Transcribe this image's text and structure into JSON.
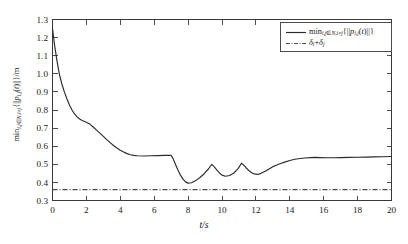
{
  "chart_data": {
    "type": "line",
    "title": "",
    "xlabel": "t/s",
    "ylabel": "min_{i,j∈N,i≠j}{||p_{i,j}(t)||}/m",
    "xlim": [
      0,
      20
    ],
    "ylim": [
      0.3,
      1.3
    ],
    "grid": false,
    "legend_position": "top-right",
    "xticks": [
      "0",
      "2",
      "4",
      "6",
      "8",
      "10",
      "12",
      "14",
      "16",
      "18",
      "20"
    ],
    "xtick_values": [
      0,
      2,
      4,
      6,
      8,
      10,
      12,
      14,
      16,
      18,
      20
    ],
    "yticks": [
      "0.3",
      "0.4",
      "0.5",
      "0.6",
      "0.7",
      "0.8",
      "0.9",
      "1.0",
      "1.1",
      "1.2",
      "1.3"
    ],
    "ytick_values": [
      0.3,
      0.4,
      0.5,
      0.6,
      0.7,
      0.8,
      0.9,
      1.0,
      1.1,
      1.2,
      1.3
    ],
    "series": [
      {
        "name": "min_distance",
        "legend_label_plain": "min_{i,j∈N,i≠j}{||p_{i,j}(t)||}",
        "style": "solid",
        "color": "#2b2b2b",
        "x": [
          0.0,
          0.12,
          0.25,
          0.4,
          0.55,
          0.7,
          0.85,
          1.0,
          1.15,
          1.3,
          1.45,
          1.6,
          1.75,
          1.9,
          2.05,
          2.2,
          2.4,
          2.6,
          2.8,
          3.0,
          3.2,
          3.4,
          3.6,
          3.8,
          4.0,
          4.2,
          4.4,
          4.6,
          4.8,
          5.0,
          5.4,
          5.8,
          6.2,
          6.6,
          6.95,
          7.0,
          7.1,
          7.25,
          7.4,
          7.55,
          7.7,
          7.85,
          8.0,
          8.2,
          8.45,
          8.7,
          8.95,
          9.2,
          9.4,
          9.55,
          9.7,
          9.85,
          10.0,
          10.2,
          10.45,
          10.7,
          10.95,
          11.15,
          11.3,
          11.45,
          11.6,
          11.75,
          11.9,
          12.1,
          12.3,
          12.55,
          12.8,
          13.0,
          13.2,
          13.45,
          13.7,
          14.0,
          14.3,
          14.6,
          14.9,
          15.2,
          15.5,
          15.8,
          16.2,
          16.6,
          17.0,
          17.5,
          18.0,
          18.5,
          19.0,
          19.5,
          20.0
        ],
        "y": [
          1.25,
          1.16,
          1.08,
          1.0,
          0.945,
          0.9,
          0.862,
          0.828,
          0.8,
          0.778,
          0.762,
          0.75,
          0.742,
          0.736,
          0.73,
          0.722,
          0.706,
          0.689,
          0.672,
          0.654,
          0.636,
          0.62,
          0.604,
          0.59,
          0.578,
          0.568,
          0.559,
          0.553,
          0.549,
          0.547,
          0.546,
          0.547,
          0.548,
          0.549,
          0.55,
          0.549,
          0.534,
          0.5,
          0.468,
          0.44,
          0.418,
          0.403,
          0.396,
          0.398,
          0.41,
          0.427,
          0.448,
          0.474,
          0.5,
          0.486,
          0.468,
          0.452,
          0.44,
          0.434,
          0.438,
          0.452,
          0.476,
          0.506,
          0.494,
          0.478,
          0.464,
          0.453,
          0.447,
          0.444,
          0.45,
          0.462,
          0.476,
          0.487,
          0.495,
          0.504,
          0.512,
          0.521,
          0.528,
          0.532,
          0.535,
          0.537,
          0.538,
          0.537,
          0.536,
          0.536,
          0.537,
          0.538,
          0.539,
          0.54,
          0.541,
          0.542,
          0.543
        ]
      },
      {
        "name": "safety_threshold",
        "legend_label_plain": "δ_i+δ_j",
        "style": "dash-dot",
        "color": "#4a4a4a",
        "constant_value": 0.36
      }
    ]
  },
  "axis_titles": {
    "x": "t/s"
  }
}
